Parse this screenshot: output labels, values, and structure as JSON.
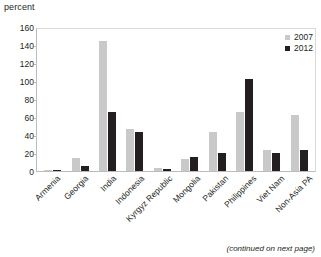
{
  "y_unit_label": "percent",
  "legend": {
    "position": "top-right",
    "entries": [
      {
        "label": "2007",
        "color": "#c9c9c9"
      },
      {
        "label": "2012",
        "color": "#231f20"
      }
    ]
  },
  "footnote": "(continued on next page)",
  "chart_data": {
    "type": "bar",
    "title": "",
    "subtitle": "",
    "xlabel": "",
    "ylabel": "percent",
    "ylim": [
      0,
      160
    ],
    "yticks": [
      0,
      20,
      40,
      60,
      80,
      100,
      120,
      140,
      160
    ],
    "ytick_labels": [
      "0",
      "20",
      "40",
      "60",
      "80",
      "100",
      "120",
      "140",
      "160"
    ],
    "grid": false,
    "legend_position": "top-right",
    "categories": [
      "Armenia",
      "Georgia",
      "India",
      "Indonesia",
      "Kyrgyz Republic",
      "Mongolia",
      "Pakistan",
      "Philippines",
      "Viet Nam",
      "Non-Asia PA"
    ],
    "series": [
      {
        "name": "2007",
        "color": "#c9c9c9",
        "values": [
          1,
          15,
          146,
          47,
          3,
          14,
          44,
          67,
          24,
          63
        ]
      },
      {
        "name": "2012",
        "color": "#231f20",
        "values": [
          1,
          6,
          66,
          44,
          2,
          16,
          20,
          104,
          20,
          24
        ]
      }
    ]
  }
}
